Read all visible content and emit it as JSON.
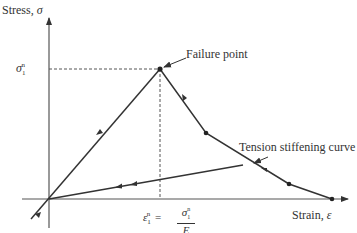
{
  "diagram": {
    "type": "stress-strain diagram",
    "axes": {
      "y_label": "Stress, ",
      "y_symbol": "σ",
      "x_label": "Strain, ",
      "x_symbol": "ε"
    },
    "annotations": {
      "failure_point": "Failure point",
      "tension_stiffening": "Tension stiffening curve",
      "sigma_label": "σ",
      "sigma_sub": "1",
      "sigma_sup": "n",
      "epsilon_label": "ε",
      "epsilon_sub": "1",
      "epsilon_sup": "n",
      "equals": "=",
      "frac_num": "σ",
      "frac_num_sub": "1",
      "frac_num_sup": "n",
      "frac_den": "E"
    },
    "colors": {
      "line": "#333333",
      "background": "#ffffff"
    }
  }
}
